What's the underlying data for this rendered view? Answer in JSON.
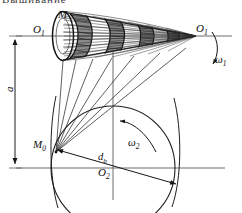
{
  "figure": {
    "title_fragment": "Вышивание",
    "type": "engineering-schematic"
  },
  "labels": {
    "worm_apex_right": "O",
    "worm_apex_right_sub": "1",
    "worm_axis_left": "O",
    "worm_axis_left_sub": "1",
    "contact_point_top": "M",
    "contact_point_bottom": "M",
    "contact_point_bottom_sub": "0",
    "wheel_center": "O",
    "wheel_center_sub": "2",
    "center_distance": "a",
    "base_diameter": "d",
    "base_diameter_sub": "b",
    "omega_worm": "ω",
    "omega_worm_sub": "1",
    "omega_wheel": "ω",
    "omega_wheel_sub": "2"
  },
  "colors": {
    "ink": "#101010",
    "line": "#2b2b2b",
    "thin": "#4a4a4a",
    "background": "#ffffff"
  },
  "geometry": {
    "worm_axis_y": 36,
    "wheel_axis_y": 168,
    "wheel_center_x": 113,
    "wheel_radius": 62,
    "apex_x": 196,
    "contact_x": 56,
    "contact_y": 152,
    "dim_line_x": 15,
    "thread_turns": 4
  }
}
